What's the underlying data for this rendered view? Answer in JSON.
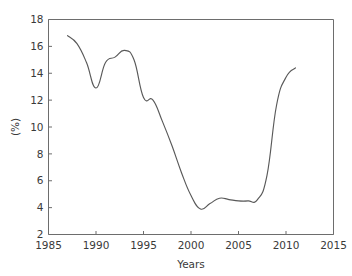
{
  "chart_data": {
    "type": "line",
    "title": "",
    "xlabel": "Years",
    "ylabel": "(%)",
    "xlim": [
      1985,
      2015
    ],
    "ylim": [
      2,
      18
    ],
    "xticks": [
      1985,
      1990,
      1995,
      2000,
      2005,
      2010,
      2015
    ],
    "xtick_labels": [
      "1985",
      "1990",
      "1995",
      "2000",
      "2005",
      "2010",
      "2015"
    ],
    "yticks": [
      2,
      4,
      6,
      8,
      10,
      12,
      14,
      16,
      18
    ],
    "ytick_labels": [
      "2",
      "4",
      "6",
      "8",
      "10",
      "12",
      "14",
      "16",
      "18"
    ],
    "grid": false,
    "legend": false,
    "line_color": "#595959",
    "axis_color": "#6d6d6d",
    "series": [
      {
        "name": "percent",
        "x": [
          1987,
          1988,
          1989,
          1990,
          1991,
          1992,
          1993,
          1994,
          1995,
          1996,
          1997,
          1998,
          1999,
          2000,
          2001,
          2002,
          2003,
          2004,
          2005,
          2006,
          2007,
          2008,
          2009,
          2010,
          2011
        ],
        "values": [
          16.8,
          16.2,
          14.8,
          12.9,
          14.8,
          15.2,
          15.7,
          15.0,
          12.2,
          12.0,
          10.4,
          8.6,
          6.6,
          4.9,
          3.9,
          4.3,
          4.7,
          4.6,
          4.5,
          4.5,
          4.6,
          6.4,
          11.6,
          13.7,
          14.4
        ]
      }
    ]
  },
  "axis": {
    "x_title": "Years",
    "y_title": "(%)"
  }
}
